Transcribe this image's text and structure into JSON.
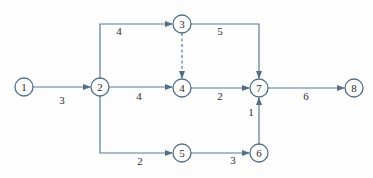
{
  "diagram": {
    "type": "activity-network",
    "colors": {
      "stroke": "#4f6f8d",
      "edge": "#5b7b98",
      "text": "#2b2b2b",
      "background": "#fdfdfd"
    },
    "nodes": [
      {
        "id": "1",
        "label": "1"
      },
      {
        "id": "2",
        "label": "2"
      },
      {
        "id": "3",
        "label": "3"
      },
      {
        "id": "4",
        "label": "4"
      },
      {
        "id": "5",
        "label": "5"
      },
      {
        "id": "6",
        "label": "6"
      },
      {
        "id": "7",
        "label": "7"
      },
      {
        "id": "8",
        "label": "8"
      }
    ],
    "edges": [
      {
        "from": "1",
        "to": "2",
        "label": "3",
        "dashed": false
      },
      {
        "from": "2",
        "to": "3",
        "label": "4",
        "dashed": false
      },
      {
        "from": "2",
        "to": "4",
        "label": "4",
        "dashed": false
      },
      {
        "from": "2",
        "to": "5",
        "label": "2",
        "dashed": false
      },
      {
        "from": "3",
        "to": "4",
        "label": "",
        "dashed": true
      },
      {
        "from": "3",
        "to": "7",
        "label": "5",
        "dashed": false
      },
      {
        "from": "4",
        "to": "7",
        "label": "2",
        "dashed": false
      },
      {
        "from": "5",
        "to": "6",
        "label": "3",
        "dashed": false
      },
      {
        "from": "6",
        "to": "7",
        "label": "1",
        "dashed": false
      },
      {
        "from": "7",
        "to": "8",
        "label": "6",
        "dashed": false
      }
    ]
  }
}
